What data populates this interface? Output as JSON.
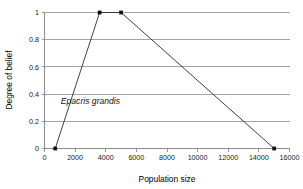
{
  "chart_data": {
    "type": "line",
    "title": "",
    "subtitle": "",
    "xlabel": "Population size",
    "ylabel": "Degree of belief",
    "xlim": [
      0,
      16000
    ],
    "ylim": [
      0,
      1
    ],
    "xticks": [
      0,
      2000,
      4000,
      6000,
      8000,
      10000,
      12000,
      14000,
      16000
    ],
    "xtick_labels": [
      "0",
      "2000",
      "4000",
      "6000",
      "8000",
      "10000",
      "12000",
      "14000",
      "16000"
    ],
    "yticks": [
      0,
      0.2,
      0.4,
      0.6,
      0.8,
      1
    ],
    "ytick_labels": [
      "0",
      "0.2",
      "0.4",
      "0.6",
      "0.8",
      "1"
    ],
    "grid": "horizontal",
    "legend": "none",
    "annotations": [
      {
        "text": "Epacris grandis",
        "x": 3000,
        "y": 0.33,
        "style": "italic"
      }
    ],
    "series": [
      {
        "name": "Epacris grandis",
        "marker": "square",
        "color": "#101010",
        "points": [
          {
            "x": 700,
            "y": 0
          },
          {
            "x": 3600,
            "y": 1
          },
          {
            "x": 5000,
            "y": 1
          },
          {
            "x": 15000,
            "y": 0
          }
        ]
      }
    ]
  },
  "axes": {
    "x_title": "Population size",
    "y_title": "Degree of belief"
  }
}
